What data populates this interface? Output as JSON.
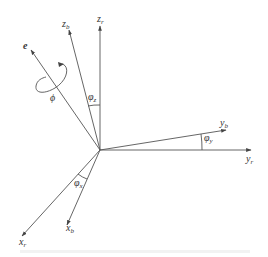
{
  "figure": {
    "type": "coordinate-frame-rotation-diagram",
    "colors": {
      "line": "#555555",
      "text": "#333333",
      "background": "#ffffff"
    },
    "origin": {
      "x": 100,
      "y": 150
    },
    "axes": [
      {
        "id": "z_r",
        "base": "z",
        "sub": "r",
        "tip": [
          100,
          26
        ]
      },
      {
        "id": "z_b",
        "base": "z",
        "sub": "b",
        "tip": [
          69,
          30
        ]
      },
      {
        "id": "e",
        "base": "e",
        "sub": "",
        "tip": [
          31,
          50
        ]
      },
      {
        "id": "y_b",
        "base": "y",
        "sub": "b",
        "tip": [
          226,
          130
        ]
      },
      {
        "id": "y_r",
        "base": "y",
        "sub": "r",
        "tip": [
          251,
          150
        ]
      },
      {
        "id": "x_r",
        "base": "x",
        "sub": "r",
        "tip": [
          22,
          236
        ]
      },
      {
        "id": "x_b",
        "base": "x",
        "sub": "b",
        "tip": [
          67,
          225
        ]
      }
    ],
    "angles": [
      {
        "id": "phi_z",
        "base": "φ",
        "sub": "z"
      },
      {
        "id": "phi_y",
        "base": "φ",
        "sub": "y"
      },
      {
        "id": "phi_x",
        "base": "φ",
        "sub": "x"
      }
    ],
    "rotation": {
      "symbol": "ϕ",
      "about_axis": "e"
    },
    "caption": ""
  }
}
